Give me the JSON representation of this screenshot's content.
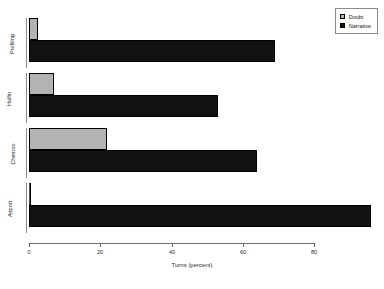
{
  "chart_data": {
    "type": "bar",
    "orientation": "horizontal",
    "title": "",
    "xlabel": "Turns (percent)",
    "ylabel": "",
    "categories": [
      "Profiling",
      "Halfin",
      "Chernoo",
      "Airport"
    ],
    "series": [
      {
        "name": "Doubt",
        "color": "#b3b3b3",
        "values": [
          2.5,
          7,
          22,
          0
        ]
      },
      {
        "name": "Narrative",
        "color": "#111111",
        "values": [
          69,
          53,
          64,
          96
        ]
      }
    ],
    "xlim": [
      0,
      80
    ],
    "xticks": [
      0,
      20,
      40,
      60,
      80
    ],
    "xtick_labels": [
      "0",
      "20",
      "40",
      "60",
      "80"
    ],
    "grid": false,
    "legend_position": "top-right"
  },
  "legend": {
    "entries": [
      {
        "label": "Doubt",
        "color": "#b3b3b3"
      },
      {
        "label": "Narrative",
        "color": "#111111"
      }
    ]
  },
  "axis": {
    "x_title": "Turns (percent)",
    "tick_labels": [
      "0",
      "20",
      "40",
      "60",
      "80"
    ]
  },
  "categories": [
    "Profiling",
    "Halfin",
    "Chernoo",
    "Airport"
  ]
}
